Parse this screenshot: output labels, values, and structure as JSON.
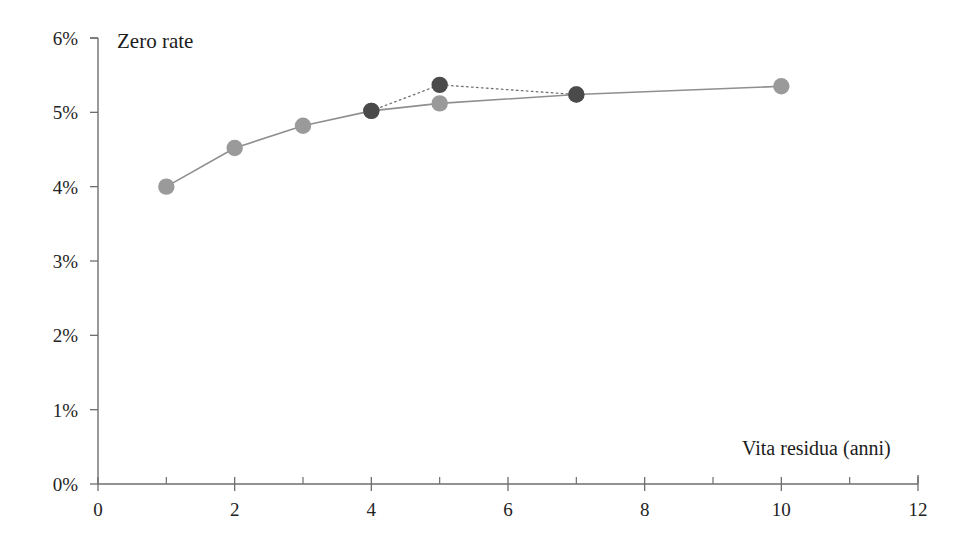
{
  "chart_data": {
    "type": "line",
    "title": "Zero rate",
    "xlabel": "Vita residua (anni)",
    "ylabel": "Zero rate",
    "xlim": [
      0,
      12
    ],
    "ylim": [
      0,
      6
    ],
    "grid": false,
    "legend": "none",
    "x_tick_labels": [
      "0",
      "2",
      "4",
      "6",
      "8",
      "10",
      "12"
    ],
    "x_tick_values": [
      0,
      2,
      4,
      6,
      8,
      10,
      12
    ],
    "x_minor_tick_values": [
      1,
      3,
      5,
      7,
      9,
      11
    ],
    "y_tick_labels": [
      "0%",
      "1%",
      "2%",
      "3%",
      "4%",
      "5%",
      "6%"
    ],
    "y_tick_values": [
      0,
      1,
      2,
      3,
      4,
      5,
      6
    ],
    "series": [
      {
        "name": "zero-rate-smooth",
        "line_style": "solid",
        "color": "#8f8f8f",
        "marker": "circle",
        "marker_color": "#9a9a9a",
        "x": [
          1,
          2,
          3,
          4,
          5,
          7,
          10
        ],
        "values": [
          4.0,
          4.52,
          4.82,
          5.02,
          5.12,
          5.24,
          5.35
        ]
      },
      {
        "name": "zero-rate-observed",
        "line_style": "dotted",
        "color": "#707070",
        "marker": "circle",
        "marker_color": "#4a4a4a",
        "x": [
          4,
          5,
          7
        ],
        "values": [
          5.02,
          5.37,
          5.24
        ]
      }
    ]
  },
  "axis": {
    "x_title": "Vita residua (anni)",
    "y_title": "Zero rate"
  }
}
